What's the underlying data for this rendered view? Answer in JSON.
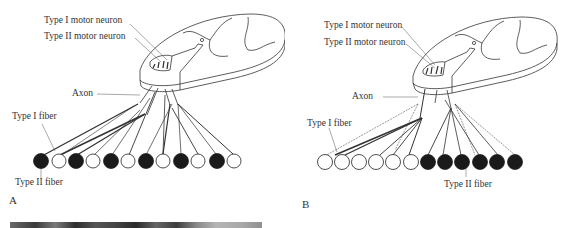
{
  "figure": {
    "panels": [
      {
        "id": "A",
        "letter": "A",
        "labels": {
          "type1_motor_neuron": "Type I motor neuron",
          "type2_motor_neuron": "Type II motor neuron",
          "axon": "Axon",
          "type1_fiber": "Type I fiber",
          "type2_fiber": "Type II fiber"
        },
        "fiber_pattern": [
          "II",
          "I",
          "II",
          "I",
          "II",
          "I",
          "II",
          "I",
          "II",
          "I",
          "II",
          "I"
        ],
        "description": "Mosaic (checkerboard) distribution of fiber types"
      },
      {
        "id": "B",
        "letter": "B",
        "labels": {
          "type1_motor_neuron": "Type I motor neuron",
          "type2_motor_neuron": "Type II motor neuron",
          "axon": "Axon",
          "type1_fiber": "Type I fiber",
          "type2_fiber": "Type II fiber"
        },
        "fiber_pattern": [
          "I",
          "I",
          "I",
          "I",
          "I",
          "I",
          "II",
          "II",
          "II",
          "II",
          "II",
          "II"
        ],
        "description": "Fiber type grouping"
      }
    ],
    "colors": {
      "type1_fiber_fill": "#ffffff",
      "type2_fiber_fill": "#1a1a1a",
      "line": "#333333"
    }
  }
}
